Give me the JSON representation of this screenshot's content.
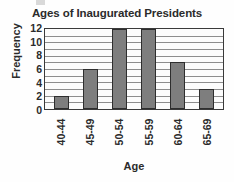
{
  "chart_data": {
    "type": "bar",
    "title": "Ages of Inaugurated Presidents",
    "xlabel": "Age",
    "ylabel": "Frequency",
    "categories": [
      "40-44",
      "45-49",
      "50-54",
      "55-59",
      "60-64",
      "65-69"
    ],
    "values": [
      2,
      6,
      12,
      12,
      7,
      3
    ],
    "ylim": [
      0,
      12
    ],
    "ytick_labels": [
      "12",
      "10",
      "8",
      "6",
      "4",
      "2",
      "0"
    ],
    "ytick_values": [
      12,
      10,
      8,
      6,
      4,
      2,
      0
    ],
    "gridline_step": 1,
    "grid": true,
    "legend": "none",
    "bar_color": "#7e7e7e",
    "bar_edge_color": "#2e2e2e",
    "plot_background": "#fcfcfc",
    "gridline_color": "#8d8d8d",
    "axis_color": "#3a3a3a",
    "xtick_rotation": -90
  }
}
